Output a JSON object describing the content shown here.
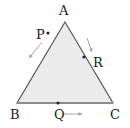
{
  "figure": {
    "kind": "geometry-diagram",
    "background_color": "#ffffff",
    "fill_color": "#ebebeb",
    "stroke_color": "#4d4d4d",
    "baseline_color": "#8c8c8c",
    "label_color": "#1a1a1a",
    "arrow_color": "#9a9a9a",
    "dot_color": "#262626"
  },
  "triangle": {
    "vertices": [
      {
        "name": "A",
        "label": "A",
        "x": 65,
        "y": 22
      },
      {
        "name": "B",
        "label": "B",
        "x": 17,
        "y": 103
      },
      {
        "name": "C",
        "label": "C",
        "x": 113,
        "y": 103
      }
    ]
  },
  "points": [
    {
      "name": "P",
      "label": "P",
      "x": 48,
      "y": 33,
      "on_edge": "AB",
      "arrow": {
        "from_x": 42,
        "from_y": 42,
        "to_x": 29,
        "to_y": 58
      }
    },
    {
      "name": "Q",
      "label": "Q",
      "x": 58,
      "y": 103,
      "on_edge": "BC",
      "arrow": {
        "from_x": 64,
        "from_y": 114,
        "to_x": 82,
        "to_y": 114
      }
    },
    {
      "name": "R",
      "label": "R",
      "x": 84,
      "y": 57,
      "on_edge": "AC",
      "arrow": {
        "from_x": 87,
        "from_y": 38,
        "to_x": 92,
        "to_y": 52
      }
    }
  ]
}
